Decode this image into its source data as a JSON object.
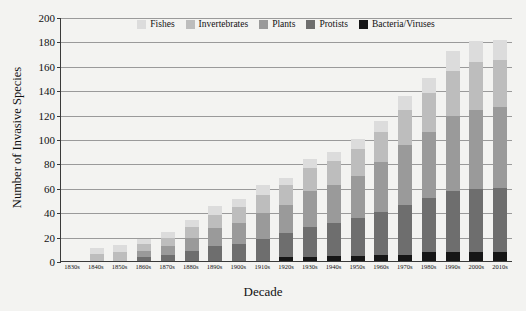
{
  "chart_data": {
    "type": "bar",
    "stacked": true,
    "title": "",
    "xlabel": "Decade",
    "ylabel": "Number of Invasive Species",
    "ylim": [
      0,
      200
    ],
    "ytick_step": 20,
    "yticks": [
      0,
      20,
      40,
      60,
      80,
      100,
      120,
      140,
      160,
      180,
      200
    ],
    "grid": true,
    "legend_position": "top-center",
    "categories": [
      "1830s",
      "1840s",
      "1850s",
      "1860s",
      "1870s",
      "1880s",
      "1890s",
      "1900s",
      "1910s",
      "1920s",
      "1930s",
      "1940s",
      "1950s",
      "1960s",
      "1970s",
      "1980s",
      "1990s",
      "2000s",
      "2010s"
    ],
    "series": [
      {
        "name": "Bacteria/Viruses",
        "color": "#161616",
        "values": [
          0,
          0,
          0,
          0,
          0,
          0,
          0,
          0,
          0,
          3,
          3,
          4,
          4,
          5,
          5,
          7,
          7,
          7,
          7
        ]
      },
      {
        "name": "Protists",
        "color": "#6e6e6e",
        "values": [
          0,
          0,
          0,
          3,
          5,
          8,
          12,
          14,
          18,
          20,
          25,
          27,
          31,
          35,
          41,
          45,
          50,
          52,
          53
        ]
      },
      {
        "name": "Plants",
        "color": "#9a9a9a",
        "values": [
          0,
          0,
          0,
          5,
          7,
          11,
          15,
          17,
          21,
          23,
          29,
          31,
          35,
          41,
          49,
          54,
          62,
          65,
          66
        ]
      },
      {
        "name": "Invertebrates",
        "color": "#bdbdbd",
        "values": [
          0,
          6,
          7,
          6,
          7,
          9,
          11,
          13,
          15,
          16,
          19,
          20,
          22,
          25,
          29,
          32,
          37,
          39,
          39
        ]
      },
      {
        "name": "Fishes",
        "color": "#dcdcdc",
        "values": [
          0,
          5,
          6,
          4,
          5,
          6,
          7,
          7,
          8,
          6,
          8,
          7,
          8,
          9,
          11,
          12,
          16,
          17,
          16
        ]
      }
    ],
    "totals": [
      0,
      11,
      13,
      18,
      24,
      34,
      45,
      51,
      62,
      68,
      84,
      89,
      100,
      115,
      135,
      150,
      172,
      180,
      181
    ]
  },
  "legend": {
    "items": [
      {
        "label": "Fishes",
        "color": "#dcdcdc"
      },
      {
        "label": "Invertebrates",
        "color": "#bdbdbd"
      },
      {
        "label": "Plants",
        "color": "#9a9a9a"
      },
      {
        "label": "Protists",
        "color": "#6e6e6e"
      },
      {
        "label": "Bacteria/Viruses",
        "color": "#161616"
      }
    ]
  }
}
